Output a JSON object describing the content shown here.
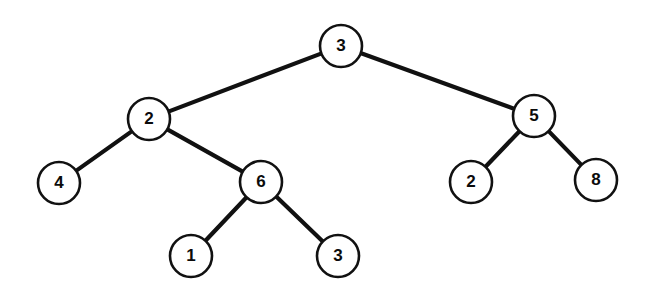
{
  "figure": {
    "type": "tree",
    "width": 647,
    "height": 300,
    "background_color": "#ffffff",
    "node_fill_color": "#ffffff",
    "node_stroke_color": "#111111",
    "edge_color": "#111111",
    "label_color": "#0b0b0b",
    "node_radius": 21
  },
  "chart_data": {
    "type": "tree",
    "node_count": 9,
    "edge_count": 8,
    "depth": 4,
    "root_id": "n0",
    "nodes": [
      {
        "id": "n0",
        "label": "3",
        "cx": 341,
        "cy": 46,
        "r": 21,
        "depth": 0,
        "parent": null
      },
      {
        "id": "n1",
        "label": "2",
        "cx": 149,
        "cy": 119,
        "r": 21,
        "depth": 1,
        "parent": "n0",
        "side": "left"
      },
      {
        "id": "n2",
        "label": "5",
        "cx": 534,
        "cy": 116,
        "r": 21,
        "depth": 1,
        "parent": "n0",
        "side": "right"
      },
      {
        "id": "n3",
        "label": "4",
        "cx": 59,
        "cy": 183,
        "r": 21,
        "depth": 2,
        "parent": "n1",
        "side": "left"
      },
      {
        "id": "n4",
        "label": "6",
        "cx": 261,
        "cy": 182,
        "r": 21,
        "depth": 2,
        "parent": "n1",
        "side": "right"
      },
      {
        "id": "n5",
        "label": "2",
        "cx": 471,
        "cy": 182,
        "r": 21,
        "depth": 2,
        "parent": "n2",
        "side": "left"
      },
      {
        "id": "n6",
        "label": "8",
        "cx": 596,
        "cy": 180,
        "r": 21,
        "depth": 2,
        "parent": "n2",
        "side": "right"
      },
      {
        "id": "n7",
        "label": "1",
        "cx": 191,
        "cy": 256,
        "r": 21,
        "depth": 3,
        "parent": "n4",
        "side": "left"
      },
      {
        "id": "n8",
        "label": "3",
        "cx": 338,
        "cy": 256,
        "r": 21,
        "depth": 3,
        "parent": "n4",
        "side": "right"
      }
    ],
    "edges": [
      {
        "id": "e0",
        "from": "n0",
        "to": "n1",
        "from_label": "3",
        "to_label": "2"
      },
      {
        "id": "e1",
        "from": "n0",
        "to": "n2",
        "from_label": "3",
        "to_label": "5"
      },
      {
        "id": "e2",
        "from": "n1",
        "to": "n3",
        "from_label": "2",
        "to_label": "4"
      },
      {
        "id": "e3",
        "from": "n1",
        "to": "n4",
        "from_label": "2",
        "to_label": "6"
      },
      {
        "id": "e4",
        "from": "n2",
        "to": "n5",
        "from_label": "5",
        "to_label": "2"
      },
      {
        "id": "e5",
        "from": "n2",
        "to": "n6",
        "from_label": "5",
        "to_label": "8"
      },
      {
        "id": "e6",
        "from": "n4",
        "to": "n7",
        "from_label": "6",
        "to_label": "1"
      },
      {
        "id": "e7",
        "from": "n4",
        "to": "n8",
        "from_label": "6",
        "to_label": "3"
      }
    ]
  }
}
